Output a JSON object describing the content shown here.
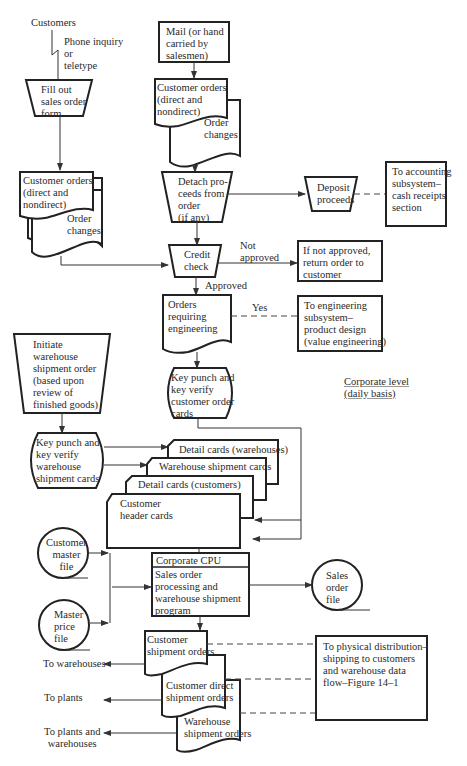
{
  "diagram": {
    "caption": "Corporate level\n(daily basis)",
    "nodes": {
      "customers": "Customers",
      "phone": "Phone inquiry\nor\nteletype",
      "fill_out": "Fill out\nsales order\nform",
      "mail": "Mail (or hand\ncarried by\nsalesmen)",
      "cust_orders_right": "Customer orders\n(direct and\nnondirect)",
      "order_changes_right": "Order\nchanges",
      "cust_orders_left": "Customer orders\n(direct and\nnondirect)",
      "order_changes_left": "Order\nchanges",
      "detach": "Detach pro-\nceeds from\norder\n(if any)",
      "deposit": "Deposit\nproceeds",
      "accounting": "To accounting\nsubsystem–\ncash receipts\nsection",
      "credit": "Credit\ncheck",
      "not_approved_label": "Not\napproved",
      "return_order": "If not approved,\nreturn order to\ncustomer",
      "approved_label": "Approved",
      "orders_eng": "Orders\nrequiring\nengineering",
      "yes_label": "Yes",
      "engineering": "To engineering\nsubsystem–\nproduct design\n(value engineering)",
      "keypunch_cust": "Key punch and\nkey verify\ncustomer order\ncards",
      "initiate": "Initiate\nwarehouse\nshipment order\n(based upon\nreview of\nfinished goods)",
      "keypunch_wh": "Key punch and\nkey verify\nwarehouse\nshipment cards",
      "card_detail_wh": "Detail cards (warehouses)",
      "card_wh_ship": "Warehouse shipment cards",
      "card_detail_cust": "Detail cards (customers)",
      "card_header": "Customer\nheader cards",
      "cust_master": "Customer\nmaster\nfile",
      "master_price": "Master\nprice\nfile",
      "cpu_title": "Corporate CPU",
      "cpu_body": "Sales order\nprocessing and\nwarehouse shipment\nprogram",
      "sales_file": "Sales\norder\nfile",
      "cust_ship": "Customer\nshipment orders",
      "cust_direct_ship": "Customer direct\nshipment orders",
      "wh_ship": "Warehouse\nshipment orders",
      "physical": "To physical distribution–\nshipping to customers\nand warehouse data\nflow–Figure 14–1",
      "to_warehouses": "To warehouses",
      "to_plants": "To plants",
      "to_plants_wh": "To plants and\nwarehouses"
    }
  }
}
